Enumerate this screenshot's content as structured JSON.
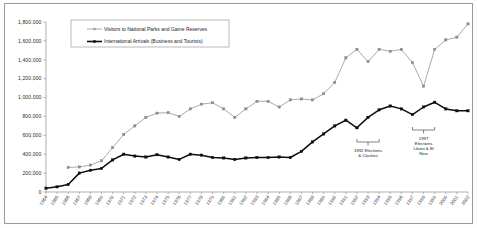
{
  "chart_data": {
    "type": "line",
    "title": "",
    "subtitle": "",
    "xlabel": "",
    "ylabel": "",
    "ylim": [
      0,
      1800000
    ],
    "ytick_step": 200000,
    "grid": false,
    "legend_position": "top-center",
    "ytick_labels": [
      "1,800,000",
      "1,600,000",
      "1,400,000",
      "1,200,000",
      "1,000,000",
      "800,000",
      "600,000",
      "400,000",
      "200,000",
      "0"
    ],
    "categories": [
      "1964",
      "1965",
      "1966",
      "1967",
      "1968",
      "1969",
      "1970",
      "1971",
      "1972",
      "1973",
      "1974",
      "1975",
      "1976",
      "1977",
      "1978",
      "1979",
      "1980",
      "1981",
      "1982",
      "1983",
      "1984",
      "1985",
      "1986",
      "1987",
      "1988",
      "1989",
      "1990",
      "1991",
      "1992",
      "1993",
      "1994",
      "1995",
      "1996",
      "1997",
      "1998",
      "1999",
      "2000",
      "2001",
      "2002"
    ],
    "series": [
      {
        "name": "Visitors to National Parks and Game Reserves",
        "color": "#9b9b9b",
        "marker": "square",
        "values": [
          null,
          null,
          260000,
          265000,
          285000,
          330000,
          470000,
          610000,
          700000,
          790000,
          835000,
          840000,
          800000,
          880000,
          930000,
          945000,
          880000,
          790000,
          880000,
          960000,
          960000,
          900000,
          975000,
          985000,
          975000,
          1040000,
          1160000,
          1420000,
          1510000,
          1380000,
          1510000,
          1490000,
          1510000,
          1370000,
          1120000,
          1510000,
          1610000,
          1640000,
          1780000
        ]
      },
      {
        "name": "International Arrivals (Business and Tourists)",
        "color": "#0d0d0d",
        "marker": "square",
        "values": [
          40000,
          55000,
          80000,
          200000,
          230000,
          250000,
          340000,
          400000,
          380000,
          370000,
          395000,
          370000,
          345000,
          400000,
          390000,
          365000,
          360000,
          345000,
          360000,
          365000,
          365000,
          370000,
          365000,
          430000,
          530000,
          615000,
          700000,
          760000,
          680000,
          790000,
          870000,
          910000,
          880000,
          820000,
          900000,
          950000,
          880000,
          860000,
          860000
        ]
      }
    ],
    "annotations": [
      {
        "id": "anno-1992",
        "text_lines": [
          "1992 Elections",
          "& Clashes"
        ],
        "span_start": "1992",
        "span_end": "1994"
      },
      {
        "id": "anno-1997",
        "text_lines": [
          "1997",
          "Elections",
          "Likoni & El",
          "Nino"
        ],
        "span_start": "1997",
        "span_end": "1999"
      }
    ]
  }
}
